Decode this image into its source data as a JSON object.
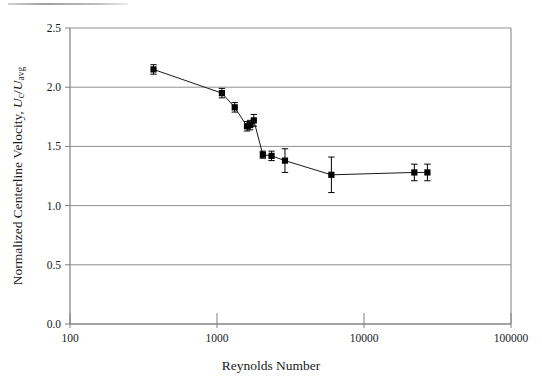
{
  "figure": {
    "background_color": "#ffffff",
    "axis_color": "#808080",
    "grid_color": "#909090",
    "marker_color": "#000000",
    "line_color": "#1a1a1a"
  },
  "axes": {
    "x": {
      "label": "Reynolds Number",
      "scale": "log",
      "min": 100,
      "max": 100000,
      "ticks": [
        100,
        1000,
        10000,
        100000
      ],
      "tick_labels": [
        "100",
        "1000",
        "10000",
        "100000"
      ]
    },
    "y": {
      "label_parts": {
        "prefix": "Normalized Centerline Velocity, ",
        "symbol_1": "U",
        "sub_1": "c",
        "slash": "/",
        "symbol_2": "U",
        "sub_2": "avg"
      },
      "label_plain": "Normalized Centerline Velocity, Uc/Uavg",
      "scale": "linear",
      "min": 0.0,
      "max": 2.5,
      "ticks": [
        0.0,
        0.5,
        1.0,
        1.5,
        2.0,
        2.5
      ],
      "tick_labels": [
        "0.0",
        "0.5",
        "1.0",
        "1.5",
        "2.0",
        "2.5"
      ]
    }
  },
  "chart_data": {
    "type": "scatter",
    "title": "",
    "xlabel": "Reynolds Number",
    "ylabel": "Normalized Centerline Velocity, Uc/Uavg",
    "xscale": "log",
    "xlim": [
      100,
      100000
    ],
    "ylim": [
      0.0,
      2.5
    ],
    "grid": "horizontal",
    "legend": "none",
    "connected": true,
    "marker": "square",
    "error_bars": "vertical",
    "series": [
      {
        "name": "Normalized centerline velocity",
        "x": [
          370,
          1080,
          1320,
          1600,
          1680,
          1780,
          2050,
          2350,
          2900,
          6000,
          22000,
          27000
        ],
        "y": [
          2.15,
          1.95,
          1.83,
          1.67,
          1.68,
          1.72,
          1.43,
          1.42,
          1.38,
          1.26,
          1.28,
          1.28
        ],
        "y_err": [
          0.04,
          0.04,
          0.04,
          0.04,
          0.04,
          0.05,
          0.03,
          0.04,
          0.1,
          0.15,
          0.07,
          0.07
        ]
      }
    ]
  }
}
